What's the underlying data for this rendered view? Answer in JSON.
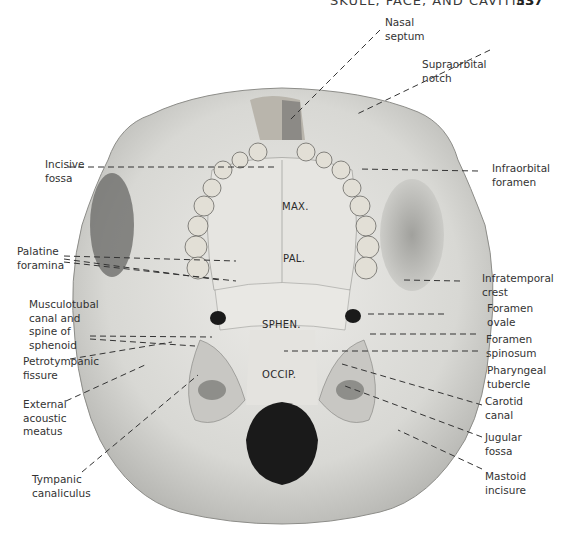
{
  "header": {
    "title": "SKULL, FACE, AND CAVITIES",
    "page_number": "337"
  },
  "figure": {
    "bone_regions": [
      {
        "id": "max",
        "text": "MAX."
      },
      {
        "id": "pal",
        "text": "PAL."
      },
      {
        "id": "sphen",
        "text": "SPHEN."
      },
      {
        "id": "occip",
        "text": "OCCIP."
      }
    ],
    "labels_left": [
      {
        "id": "incisive-fossa",
        "text": "Incisive\nfossa"
      },
      {
        "id": "palatine-foramina",
        "text": "Palatine\nforamina"
      },
      {
        "id": "musculotubal-canal",
        "text": "Musculotubal\ncanal and\nspine of\nsphenoid"
      },
      {
        "id": "petrotympanic-fissure",
        "text": "Petrotympanic\nfissure"
      },
      {
        "id": "external-acoustic-meatus",
        "text": "External\nacoustic\nmeatus"
      },
      {
        "id": "tympanic-canaliculus",
        "text": "Tympanic\ncanaliculus"
      }
    ],
    "labels_right": [
      {
        "id": "nasal-septum",
        "text": "Nasal\nseptum"
      },
      {
        "id": "supraorbital-notch",
        "text": "Supraorbital\nnotch"
      },
      {
        "id": "infraorbital-foramen",
        "text": "Infraorbital\nforamen"
      },
      {
        "id": "infratemporal-crest",
        "text": "Infratemporal\ncrest"
      },
      {
        "id": "foramen-ovale",
        "text": "Foramen\novale"
      },
      {
        "id": "foramen-spinosum",
        "text": "Foramen\nspinosum"
      },
      {
        "id": "pharyngeal-tubercle",
        "text": "Pharyngeal\ntubercle"
      },
      {
        "id": "carotid-canal",
        "text": "Carotid\ncanal"
      },
      {
        "id": "jugular-fossa",
        "text": "Jugular\nfossa"
      },
      {
        "id": "mastoid-incisure",
        "text": "Mastoid\nincisure"
      }
    ]
  },
  "colors": {
    "bone": "#dcdcd8",
    "bone_shadow": "#a9a9a5",
    "foramen_dark": "#1a1a1a",
    "leader_line": "#333333",
    "text": "#333333"
  }
}
